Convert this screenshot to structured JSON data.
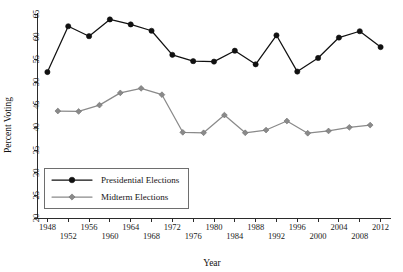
{
  "chart_data": {
    "type": "line",
    "title": "",
    "xlabel": "Year",
    "ylabel": "Percent Voting",
    "xlim": [
      1946,
      2014
    ],
    "ylim": [
      20,
      65
    ],
    "grid": false,
    "legend_position": "lower-left",
    "y_ticks": [
      20,
      25,
      30,
      35,
      40,
      45,
      50,
      55,
      60,
      65
    ],
    "x_ticks": [
      1948,
      1952,
      1956,
      1960,
      1964,
      1968,
      1972,
      1976,
      1980,
      1984,
      1988,
      1992,
      1996,
      2000,
      2004,
      2008,
      2012
    ],
    "x_tick_labels_row1": [
      "1948",
      "",
      "1956",
      "",
      "1964",
      "",
      "1972",
      "",
      "1980",
      "",
      "1988",
      "",
      "1996",
      "",
      "2004",
      "",
      "2012"
    ],
    "x_tick_labels_row2": [
      "",
      "1952",
      "",
      "1960",
      "",
      "1968",
      "",
      "1976",
      "",
      "1984",
      "",
      "1992",
      "",
      "2000",
      "",
      "2008",
      ""
    ],
    "series": [
      {
        "name": "Presidential Elections",
        "color": "#111111",
        "marker": "circle",
        "x": [
          1948,
          1952,
          1956,
          1960,
          1964,
          1968,
          1972,
          1976,
          1980,
          1984,
          1988,
          1992,
          1996,
          2000,
          2004,
          2008,
          2012
        ],
        "values": [
          52.2,
          62.3,
          60.1,
          63.8,
          62.7,
          61.3,
          56.0,
          54.6,
          54.5,
          56.9,
          53.9,
          60.3,
          52.3,
          55.3,
          59.8,
          61.2,
          57.7
        ]
      },
      {
        "name": "Midterm Elections",
        "color": "#8a8a8a",
        "marker": "diamond",
        "x": [
          1950,
          1954,
          1958,
          1962,
          1966,
          1970,
          1974,
          1978,
          1982,
          1986,
          1990,
          1994,
          1998,
          2002,
          2006,
          2010
        ],
        "values": [
          43.6,
          43.5,
          44.9,
          47.6,
          48.6,
          47.2,
          38.9,
          38.8,
          42.7,
          38.8,
          39.4,
          41.4,
          38.7,
          39.2,
          40.0,
          40.5
        ]
      }
    ]
  },
  "legend": {
    "entries": [
      {
        "label": "Presidential Elections"
      },
      {
        "label": "Midterm Elections"
      }
    ]
  }
}
